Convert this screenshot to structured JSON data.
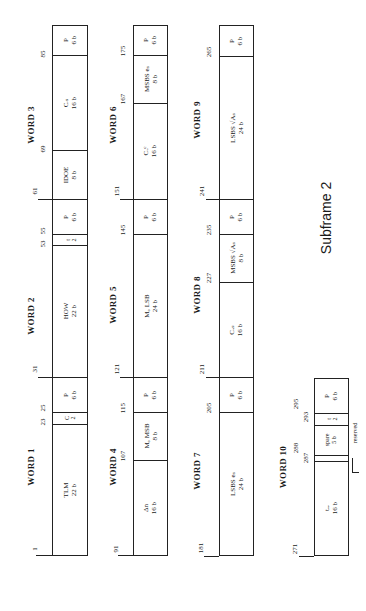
{
  "title": "Subframe 2",
  "words": [
    {
      "label": "WORD 1",
      "start_bit": "1",
      "fields": [
        {
          "name": "TLM",
          "bits": "22 b"
        },
        {
          "name": "C",
          "bits": "2"
        },
        {
          "name": "P",
          "bits": "6 b"
        }
      ],
      "ticks": [
        "23",
        "25"
      ]
    },
    {
      "label": "WORD 2",
      "start_bit": "31",
      "fields": [
        {
          "name": "HOW",
          "bits": "22 b"
        },
        {
          "name": "t",
          "bits": "2"
        },
        {
          "name": "P",
          "bits": "6 b"
        }
      ],
      "ticks": [
        "53",
        "55"
      ]
    },
    {
      "label": "WORD 3",
      "start_bit": "61",
      "fields": [
        {
          "name": "IDOE",
          "bits": "8 b"
        },
        {
          "name": "Cᵣₛ",
          "bits": "16 b"
        },
        {
          "name": "P",
          "bits": "6 b"
        }
      ],
      "ticks": [
        "69",
        "85"
      ]
    },
    {
      "label": "WORD 4",
      "start_bit": "91",
      "fields": [
        {
          "name": "Δn",
          "bits": "16 b"
        },
        {
          "name": "M₀ MSB",
          "bits": "8 b"
        },
        {
          "name": "P",
          "bits": "6 b"
        }
      ],
      "ticks": [
        "107",
        "115"
      ]
    },
    {
      "label": "WORD 5",
      "start_bit": "121",
      "fields": [
        {
          "name": "M₀ LSB",
          "bits": "24 b"
        },
        {
          "name": "P",
          "bits": "6 b"
        }
      ],
      "ticks": [
        "145"
      ]
    },
    {
      "label": "WORD 6",
      "start_bit": "151",
      "fields": [
        {
          "name": "Cᵤᶜ",
          "bits": "16 b"
        },
        {
          "name": "MSBS eₛ",
          "bits": "8 b"
        },
        {
          "name": "P",
          "bits": "6 b"
        }
      ],
      "ticks": [
        "167",
        "175"
      ]
    },
    {
      "label": "WORD 7",
      "start_bit": "181",
      "fields": [
        {
          "name": "LSBS eₛ",
          "bits": "24 b"
        },
        {
          "name": "P",
          "bits": "6 b"
        }
      ],
      "ticks": [
        "205"
      ]
    },
    {
      "label": "WORD 8",
      "start_bit": "211",
      "fields": [
        {
          "name": "Cᵤₛ",
          "bits": "16 b"
        },
        {
          "name": "MSBS √Aₛ",
          "bits": "8 b"
        },
        {
          "name": "P",
          "bits": "6 b"
        }
      ],
      "ticks": [
        "227",
        "235"
      ]
    },
    {
      "label": "WORD 9",
      "start_bit": "241",
      "fields": [
        {
          "name": "LSBS √Aₛ",
          "bits": "24 b"
        },
        {
          "name": "P",
          "bits": "6 b"
        }
      ],
      "ticks": [
        "265"
      ]
    },
    {
      "label": "WORD 10",
      "start_bit": "271",
      "fields": [
        {
          "name": "tₒₑ",
          "bits": "16 b"
        },
        {
          "name": "",
          "bits": ""
        },
        {
          "name": "spare",
          "bits": "5 b"
        },
        {
          "name": "t",
          "bits": "2"
        },
        {
          "name": "P",
          "bits": "6 b"
        }
      ],
      "ticks": [
        "287",
        "288",
        "293",
        "295"
      ],
      "annotation": "reserved"
    }
  ]
}
